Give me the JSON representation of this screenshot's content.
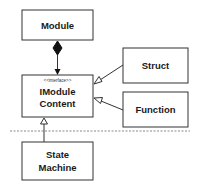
{
  "diagram": {
    "type": "uml-class",
    "nodes": {
      "module": {
        "label": "Module"
      },
      "imodule_content": {
        "stereotype": "<<interface>>",
        "label_line1": "IModule",
        "label_line2": "Content"
      },
      "struct": {
        "label": "Struct"
      },
      "function": {
        "label": "Function"
      },
      "state_machine": {
        "label_line1": "State",
        "label_line2": "Machine"
      }
    },
    "edges": [
      {
        "from": "module",
        "to": "imodule_content",
        "kind": "composition"
      },
      {
        "from": "struct",
        "to": "imodule_content",
        "kind": "realization"
      },
      {
        "from": "function",
        "to": "imodule_content",
        "kind": "realization"
      },
      {
        "from": "state_machine",
        "to": "imodule_content",
        "kind": "realization"
      }
    ],
    "separator": "dashed"
  },
  "colors": {
    "stroke": "#333333",
    "fill": "#ffffff",
    "separator": "#888888"
  }
}
